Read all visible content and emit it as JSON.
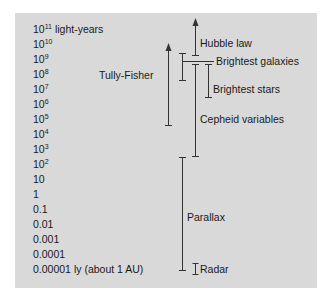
{
  "chart_data": {
    "type": "diagram",
    "axis_labels": [
      {
        "base": "10",
        "exp": "11",
        "suffix": " light-years"
      },
      {
        "base": "10",
        "exp": "10",
        "suffix": ""
      },
      {
        "base": "10",
        "exp": "9",
        "suffix": ""
      },
      {
        "base": "10",
        "exp": "8",
        "suffix": ""
      },
      {
        "base": "10",
        "exp": "7",
        "suffix": ""
      },
      {
        "base": "10",
        "exp": "6",
        "suffix": ""
      },
      {
        "base": "10",
        "exp": "5",
        "suffix": ""
      },
      {
        "base": "10",
        "exp": "4",
        "suffix": ""
      },
      {
        "base": "10",
        "exp": "3",
        "suffix": ""
      },
      {
        "base": "10",
        "exp": "2",
        "suffix": ""
      },
      {
        "base": "10",
        "exp": "",
        "suffix": ""
      },
      {
        "base": "1",
        "exp": "",
        "suffix": ""
      },
      {
        "base": "0.1",
        "exp": "",
        "suffix": ""
      },
      {
        "base": "0.01",
        "exp": "",
        "suffix": ""
      },
      {
        "base": "0.001",
        "exp": "",
        "suffix": ""
      },
      {
        "base": "0.0001",
        "exp": "",
        "suffix": ""
      },
      {
        "base": "0.00001",
        "exp": "",
        "suffix": " ly (about 1 AU)"
      }
    ],
    "methods": [
      {
        "name": "Hubble law",
        "range_ly": [
          "~10^9",
          "10^11+"
        ],
        "open_ended": true
      },
      {
        "name": "Brightest galaxies",
        "range_ly": [
          "~10^8",
          "~10^10"
        ]
      },
      {
        "name": "Tully-Fisher",
        "range_ly": [
          "~10^5",
          "10^10+"
        ],
        "open_ended": true
      },
      {
        "name": "Brightest stars",
        "range_ly": [
          "~10^6",
          "~10^9"
        ]
      },
      {
        "name": "Cepheid variables",
        "range_ly": [
          "~10^2",
          "~10^9"
        ]
      },
      {
        "name": "Parallax",
        "range_ly": [
          "~0.00001",
          "~10^2"
        ]
      },
      {
        "name": "Radar",
        "range_ly": [
          "~0.00001",
          "~0.0001"
        ]
      }
    ]
  },
  "labels": {
    "hubble": "Hubble law",
    "brightest_galaxies": "Brightest galaxies",
    "tully_fisher": "Tully-Fisher",
    "brightest_stars": "Brightest stars",
    "cepheid": "Cepheid variables",
    "parallax": "Parallax",
    "radar": "Radar"
  }
}
